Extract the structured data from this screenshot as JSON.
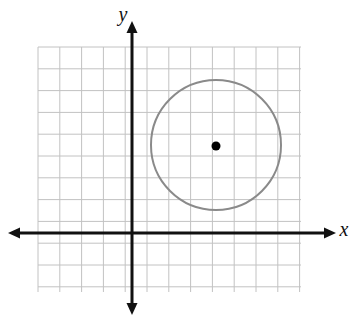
{
  "figure": {
    "width": 359,
    "height": 327,
    "background_color": "#ffffff"
  },
  "axes": {
    "x_axis_label": "x",
    "y_axis_label": "y",
    "axis_color": "#111111",
    "axis_stroke_width": 3,
    "origin_px": {
      "x": 132,
      "y": 233
    },
    "x_axis_px": {
      "x_start": 8,
      "x_end": 336,
      "y": 233
    },
    "y_axis_px": {
      "y_start": 21,
      "y_end": 315,
      "x": 132
    },
    "arrowheads": [
      "left",
      "right",
      "up",
      "down"
    ],
    "tick_labels": []
  },
  "grid": {
    "color": "#c2c2c2",
    "stroke_width": 1,
    "spacing_px": 21.8,
    "left_px": 38,
    "right_px": 301,
    "top_px": 47,
    "bottom_px": 292,
    "columns": 12,
    "rows": 11
  },
  "chart_data": {
    "type": "scatter",
    "xlabel": "x",
    "ylabel": "y",
    "grid": true,
    "legend": "none",
    "xlim": [
      -4.3,
      7.8
    ],
    "ylim": [
      -2.7,
      8.5
    ],
    "shapes": [
      {
        "kind": "circle",
        "center": {
          "x": 3.85,
          "y": 4.05
        },
        "radius": 3,
        "stroke_color": "#8a8a8a",
        "stroke_width": 2,
        "fill": "none",
        "center_px": {
          "x": 216,
          "y": 145
        },
        "radius_px": 65
      }
    ],
    "points": [
      {
        "label": "center",
        "x": 3.85,
        "y": 4.05,
        "color": "#000000",
        "marker": "filled-circle",
        "marker_size_px": 9,
        "px": {
          "x": 216,
          "y": 146
        }
      }
    ]
  }
}
